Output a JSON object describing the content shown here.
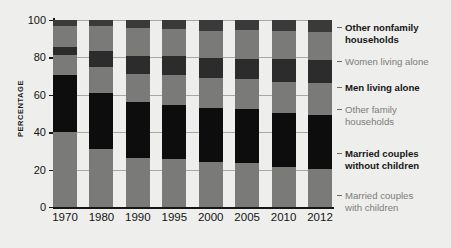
{
  "chart_data": {
    "type": "bar",
    "subtype": "stacked-percentage-column",
    "title": "",
    "xlabel": "",
    "ylabel": "PERCENTAGE",
    "ylim": [
      0,
      100
    ],
    "yticks": [
      0,
      20,
      40,
      60,
      80,
      100
    ],
    "ytick_labels": [
      "0",
      "20",
      "40",
      "60",
      "80",
      "100"
    ],
    "grid": true,
    "grid_axis": "y",
    "legend_position": "right",
    "categories": [
      "1970",
      "1980",
      "1990",
      "1995",
      "2000",
      "2005",
      "2010",
      "2012"
    ],
    "series": [
      {
        "name": "Married couples with children",
        "color": "#7a7a78",
        "values": [
          40.3,
          30.9,
          26.3,
          25.5,
          24.1,
          23.3,
          21.4,
          20.2
        ]
      },
      {
        "name": "Married couples without children",
        "color": "#0d0d0d",
        "values": [
          30.3,
          29.9,
          29.8,
          29.0,
          28.7,
          28.9,
          28.9,
          29.0
        ]
      },
      {
        "name": "Other family households",
        "color": "#7a7a78",
        "values": [
          10.6,
          13.9,
          15.0,
          16.0,
          16.0,
          16.1,
          16.6,
          17.2
        ]
      },
      {
        "name": "Men living alone",
        "color": "#2c2c2c",
        "values": [
          4.3,
          8.6,
          9.7,
          10.2,
          10.7,
          11.1,
          12.2,
          12.3
        ]
      },
      {
        "name": "Women living alone",
        "color": "#7a7a78",
        "values": [
          11.5,
          13.4,
          14.9,
          14.5,
          14.8,
          15.0,
          14.8,
          14.9
        ]
      },
      {
        "name": "Other nonfamily households",
        "color": "#3a3a3a",
        "values": [
          3.0,
          3.3,
          4.3,
          4.8,
          5.7,
          5.6,
          6.1,
          6.4
        ]
      }
    ],
    "legend_entries": [
      {
        "label_lines": [
          "Other nonfamily",
          "households"
        ],
        "emphasis": "bold",
        "color": "#161616"
      },
      {
        "label_lines": [
          "Women living alone"
        ],
        "emphasis": "normal",
        "color": "#7d7d7b"
      },
      {
        "label_lines": [
          "Men living alone"
        ],
        "emphasis": "bold",
        "color": "#161616"
      },
      {
        "label_lines": [
          "Other family",
          "households"
        ],
        "emphasis": "normal",
        "color": "#7d7d7b"
      },
      {
        "label_lines": [
          "Married couples",
          "without children"
        ],
        "emphasis": "bold",
        "color": "#161616"
      },
      {
        "label_lines": [
          "Married couples",
          "with children"
        ],
        "emphasis": "normal",
        "color": "#7d7d7b"
      }
    ]
  },
  "colors": {
    "background": "#eeeeec",
    "axis": "#161616",
    "gridline": "#9a9a98",
    "gray_segment": "#7a7a78",
    "black_segment": "#0d0d0d",
    "dark_gray_segment": "#2c2c2c",
    "top_segment": "#3a3a3a",
    "legend_bold_text": "#161616",
    "legend_gray_text": "#7d7d7b"
  }
}
